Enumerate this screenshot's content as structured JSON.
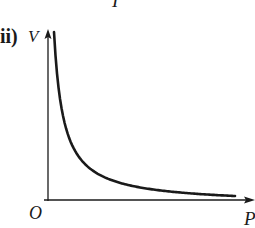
{
  "fragment_label": "I",
  "part_label": "ii)",
  "chart_data": {
    "type": "line",
    "title": "",
    "xlabel": "P",
    "ylabel": "V",
    "origin_label": "O",
    "grid": false,
    "legend": null,
    "axis_ticks": false,
    "series": [
      {
        "name": "V vs P",
        "relation": "V = k / P",
        "x": [
          0.05,
          0.1,
          0.15,
          0.2,
          0.3,
          0.4,
          0.5,
          0.6,
          0.7,
          0.8,
          0.9,
          1.0
        ],
        "values": [
          1.0,
          0.5,
          0.33,
          0.25,
          0.17,
          0.125,
          0.1,
          0.083,
          0.071,
          0.0625,
          0.056,
          0.05
        ]
      }
    ],
    "xlim": [
      0,
      1.05
    ],
    "ylim": [
      0,
      1.05
    ]
  },
  "colors": {
    "ink": "#1a1a1a",
    "background": "#ffffff"
  }
}
